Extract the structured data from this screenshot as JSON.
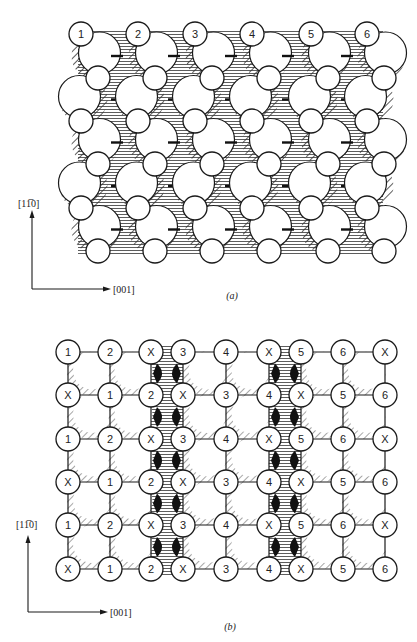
{
  "figure": {
    "panels": [
      {
        "id": "a",
        "caption": "(a)",
        "axes": {
          "vertical_label": "[11̅0]",
          "horizontal_label": "[001]"
        },
        "top_row_labels": [
          "1",
          "2",
          "3",
          "4",
          "5",
          "6"
        ],
        "rows": 6,
        "columns": 6,
        "structure": "zigzag chains of atoms with hatched large-atom arcs and horizontally hatched channels"
      },
      {
        "id": "b",
        "caption": "(b)",
        "axes": {
          "vertical_label": "[11̅0]",
          "horizontal_label": "[001]"
        },
        "grid_labels": [
          [
            "1",
            "2",
            "X",
            "3",
            "4",
            "X",
            "5",
            "6",
            "X"
          ],
          [
            "X",
            "1",
            "2",
            "X",
            "3",
            "4",
            "X",
            "5",
            "6"
          ],
          [
            "1",
            "2",
            "X",
            "3",
            "4",
            "X",
            "5",
            "6",
            "X"
          ],
          [
            "X",
            "1",
            "2",
            "X",
            "3",
            "4",
            "X",
            "5",
            "6"
          ],
          [
            "1",
            "2",
            "X",
            "3",
            "4",
            "X",
            "5",
            "6",
            "X"
          ],
          [
            "X",
            "1",
            "2",
            "X",
            "3",
            "4",
            "X",
            "5",
            "6"
          ]
        ],
        "structure": "square grid of labeled atoms with hatched channels between columns 3-4 and 6-7"
      }
    ]
  }
}
